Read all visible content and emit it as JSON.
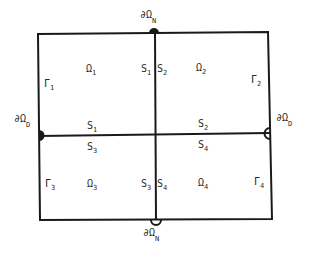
{
  "diagram": {
    "type": "domain-decomposition",
    "subdomains": [
      {
        "label": "Ω",
        "sub": "1"
      },
      {
        "label": "Ω",
        "sub": "2"
      },
      {
        "label": "Ω",
        "sub": "3"
      },
      {
        "label": "Ω",
        "sub": "4"
      }
    ],
    "outer_boundaries": [
      {
        "label": "Γ",
        "sub": "1"
      },
      {
        "label": "Γ",
        "sub": "2"
      },
      {
        "label": "Γ",
        "sub": "3"
      },
      {
        "label": "Γ",
        "sub": "4"
      }
    ],
    "interfaces": {
      "s1": {
        "label": "S",
        "sub": "1"
      },
      "s2": {
        "label": "S",
        "sub": "2"
      },
      "s3": {
        "label": "S",
        "sub": "3"
      },
      "s4": {
        "label": "S",
        "sub": "4"
      }
    },
    "boundary_markers": {
      "neumann_top": {
        "label": "∂Ω",
        "sub": "N"
      },
      "neumann_bottom": {
        "label": "∂Ω",
        "sub": "N"
      },
      "dirichlet_left": {
        "label": "∂Ω",
        "sub": "D"
      },
      "dirichlet_right": {
        "label": "∂Ω",
        "sub": "D"
      }
    }
  }
}
